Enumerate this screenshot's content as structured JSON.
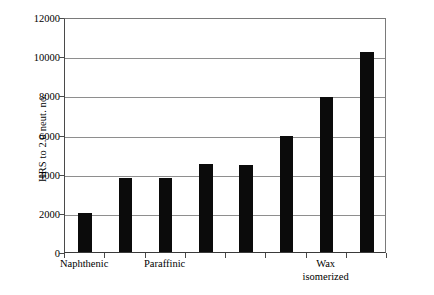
{
  "chart_data": {
    "type": "bar",
    "title": "",
    "subtitle": "",
    "xlabel": "",
    "ylabel": "HRS to 2.0 neut. no.",
    "ylim": [
      0,
      12000
    ],
    "ytick_values": [
      0,
      2000,
      4000,
      6000,
      8000,
      10000,
      12000
    ],
    "ytick_labels": [
      "0",
      "2000",
      "4000",
      "6000",
      "8000",
      "10000",
      "12000"
    ],
    "grid": "horizontal",
    "legend": "none",
    "bar_color": "#0b0b0b",
    "gridline_color": "#8e8e8e",
    "axis_color": "#4a4a4a",
    "background_color": "#ffffff",
    "categories": [
      "1",
      "2",
      "3",
      "4",
      "5",
      "6",
      "7",
      "8"
    ],
    "values": [
      2000,
      3800,
      3800,
      4500,
      4450,
      5900,
      7900,
      10200
    ],
    "group_labels": [
      {
        "text": "Naphthenic",
        "line2": "",
        "bar_index": 0
      },
      {
        "text": "Paraffinic",
        "line2": "",
        "bar_index": 2
      },
      {
        "text": "Wax",
        "line2": "isomerized",
        "bar_index": 6
      }
    ],
    "annotations": []
  }
}
